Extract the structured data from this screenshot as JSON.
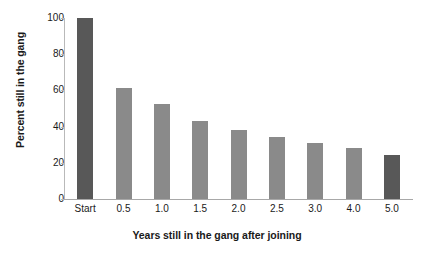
{
  "chart_data": {
    "type": "bar",
    "title": "",
    "xlabel": "Years still in the gang after joining",
    "ylabel": "Percent still in the gang",
    "categories": [
      "Start",
      "0.5",
      "1.0",
      "1.5",
      "2.0",
      "2.5",
      "3.0",
      "4.0",
      "5.0"
    ],
    "values": [
      100,
      61.5,
      52.5,
      43,
      38,
      34,
      31,
      28,
      24.5
    ],
    "ylim": [
      0,
      100
    ],
    "yticks": [
      0,
      20,
      40,
      60,
      80,
      100
    ],
    "ytick_labels": [
      "0",
      "20",
      "40",
      "60",
      "80",
      "100"
    ],
    "grid": false,
    "legend": "none",
    "bar_colors": [
      "#585858",
      "#8a8a8a",
      "#8a8a8a",
      "#8a8a8a",
      "#8a8a8a",
      "#8a8a8a",
      "#8a8a8a",
      "#8a8a8a",
      "#585858"
    ],
    "colors": {
      "highlight": "#585858",
      "standard": "#8a8a8a",
      "axis": "#a8a8a8",
      "background": "#ffffff",
      "text": "#1a1a1a"
    }
  }
}
